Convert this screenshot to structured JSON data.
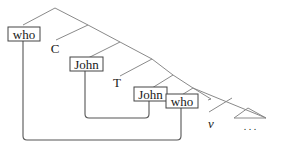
{
  "diagram": {
    "type": "syntax-tree",
    "nodes": {
      "who_spec": "who",
      "c_head": "C",
      "john_spec": "John",
      "t_head": "T",
      "john_vp": "John",
      "who_vp": "who",
      "v_head": "v",
      "ellipsis": ". . ."
    },
    "boxed": [
      "who_spec",
      "john_spec",
      "john_vp",
      "who_vp"
    ],
    "movement_arrows": [
      {
        "from": "who_vp",
        "to": "who_spec"
      },
      {
        "from": "john_vp",
        "to": "john_spec"
      }
    ],
    "colors": {
      "tree_lines": "#8a8a8a",
      "movement_lines": "#555555",
      "box_border": "#444444",
      "text": "#1a1a1a",
      "background": "#ffffff"
    }
  }
}
